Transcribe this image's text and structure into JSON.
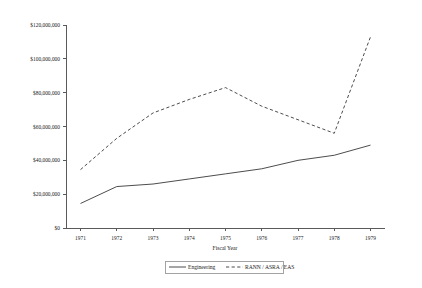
{
  "chart_data": {
    "type": "line",
    "title": "",
    "xlabel": "Fiscal Year",
    "ylabel": "",
    "x": [
      1971,
      1972,
      1973,
      1974,
      1975,
      1976,
      1977,
      1978,
      1979
    ],
    "categories": [
      "1971",
      "1972",
      "1973",
      "1974",
      "1975",
      "1976",
      "1977",
      "1978",
      "1979"
    ],
    "xlim": [
      1970.6,
      1979.4
    ],
    "ylim": [
      0,
      120000000
    ],
    "yticks": [
      0,
      20000000,
      40000000,
      60000000,
      80000000,
      100000000,
      120000000
    ],
    "ytick_labels": [
      "$0",
      "$20,000,000",
      "$40,000,000",
      "$60,000,000",
      "$80,000,000",
      "$100,000,000",
      "$120,000,000"
    ],
    "xtick_labels": [
      "1971",
      "1972",
      "1973",
      "1974",
      "1975",
      "1976",
      "1977",
      "1978",
      "1979"
    ],
    "grid": false,
    "legend_position": "bottom",
    "series": [
      {
        "name": "Engineering",
        "style": "solid",
        "color": "#4d4d4d",
        "values": [
          14500000,
          24500000,
          26000000,
          29000000,
          32000000,
          35000000,
          40000000,
          43000000,
          49000000
        ]
      },
      {
        "name": "RANN / ASRA / EAS",
        "style": "dashed",
        "color": "#4d4d4d",
        "values": [
          34500000,
          53000000,
          68000000,
          76000000,
          83000000,
          72000000,
          64000000,
          56000000,
          113000000
        ]
      }
    ]
  },
  "legend": {
    "items": [
      {
        "label": "Engineering",
        "style": "solid"
      },
      {
        "label": "RANN / ASRA / EAS",
        "style": "dashed"
      }
    ]
  }
}
